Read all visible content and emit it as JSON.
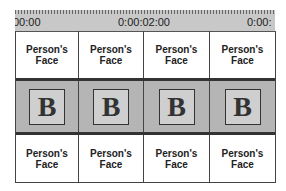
{
  "ruler": {
    "timecodes": [
      {
        "label": "00:00",
        "x": 0
      },
      {
        "label": "0:00:02:00",
        "x": 103
      },
      {
        "label": "0:00:",
        "x": 232
      }
    ]
  },
  "tracks": {
    "top": [
      "Person's Face",
      "Person's Face",
      "Person's Face",
      "Person's Face"
    ],
    "thumbnails": [
      "B",
      "B",
      "B",
      "B"
    ],
    "bottom": [
      "Person's Face",
      "Person's Face",
      "Person's Face",
      "Person's Face"
    ]
  }
}
